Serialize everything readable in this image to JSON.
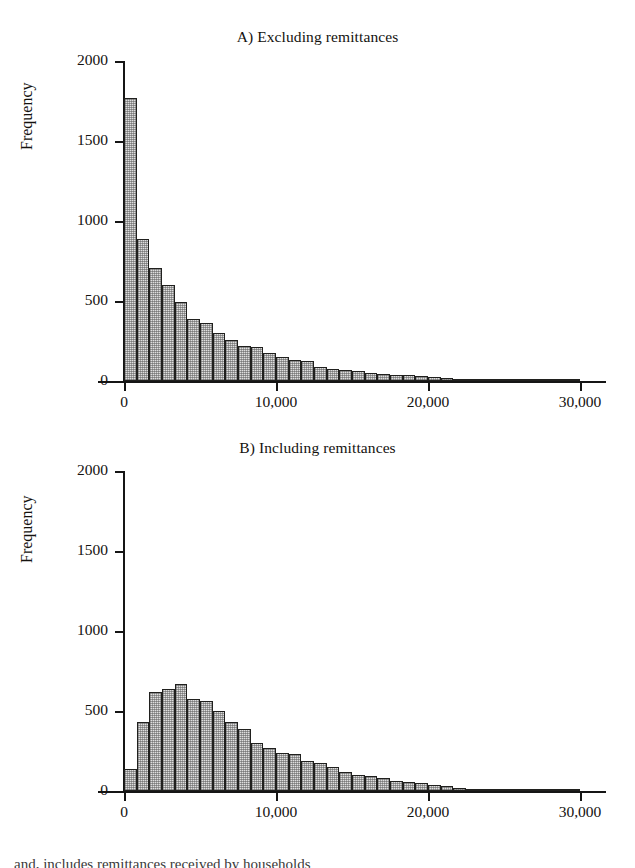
{
  "figure": {
    "width": 635,
    "height": 868,
    "background": "#ffffff",
    "ink_color": "#151515",
    "bar_fill": "#dedede",
    "bar_edge": "#20201e"
  },
  "footnote": {
    "text": "and, includes remittances received by households"
  },
  "chart_data": [
    {
      "type": "bar",
      "panel": "A",
      "title": "A) Excluding remittances",
      "xlabel": "",
      "ylabel": "Frequency",
      "xlim": [
        0,
        30000
      ],
      "ylim": [
        0,
        2000
      ],
      "grid": false,
      "legend": null,
      "xticks": [
        0,
        10000,
        20000,
        30000
      ],
      "xtick_labels": [
        "0",
        "10,000",
        "20,000",
        "30,000"
      ],
      "yticks": [
        0,
        500,
        1000,
        1500,
        2000
      ],
      "ytick_labels": [
        "0",
        "500",
        "1000",
        "1500",
        "2000"
      ],
      "bin_width": 833,
      "bin_starts": [
        0,
        833,
        1666,
        2499,
        3332,
        4165,
        4998,
        5831,
        6664,
        7497,
        8330,
        9163,
        9996,
        10829,
        11662,
        12495,
        13328,
        14161,
        14994,
        15827,
        16660,
        17493,
        18326,
        19159,
        19992,
        20825,
        21658,
        22491,
        23324,
        24157,
        24990,
        25823,
        26656,
        27489,
        28322,
        29155
      ],
      "values": [
        1770,
        885,
        705,
        600,
        495,
        390,
        365,
        300,
        255,
        220,
        215,
        175,
        150,
        130,
        125,
        90,
        75,
        70,
        60,
        50,
        45,
        40,
        40,
        30,
        25,
        18,
        12,
        8,
        10,
        6,
        4,
        3,
        2,
        2,
        1,
        6
      ]
    },
    {
      "type": "bar",
      "panel": "B",
      "title": "B) Including remittances",
      "xlabel": "",
      "ylabel": "Frequency",
      "xlim": [
        0,
        30000
      ],
      "ylim": [
        0,
        2000
      ],
      "grid": false,
      "legend": null,
      "xticks": [
        0,
        10000,
        20000,
        30000
      ],
      "xtick_labels": [
        "0",
        "10,000",
        "20,000",
        "30,000"
      ],
      "yticks": [
        0,
        500,
        1000,
        1500,
        2000
      ],
      "ytick_labels": [
        "0",
        "500",
        "1000",
        "1500",
        "2000"
      ],
      "bin_width": 833,
      "bin_starts": [
        0,
        833,
        1666,
        2499,
        3332,
        4165,
        4998,
        5831,
        6664,
        7497,
        8330,
        9163,
        9996,
        10829,
        11662,
        12495,
        13328,
        14161,
        14994,
        15827,
        16660,
        17493,
        18326,
        19159,
        19992,
        20825,
        21658,
        22491,
        23324,
        24157,
        24990,
        25823,
        26656,
        27489,
        28322,
        29155
      ],
      "values": [
        140,
        430,
        620,
        640,
        670,
        575,
        560,
        500,
        430,
        390,
        300,
        270,
        240,
        230,
        190,
        175,
        150,
        120,
        100,
        95,
        80,
        65,
        55,
        50,
        40,
        30,
        20,
        12,
        8,
        6,
        5,
        3,
        2,
        2,
        1,
        3
      ]
    }
  ]
}
